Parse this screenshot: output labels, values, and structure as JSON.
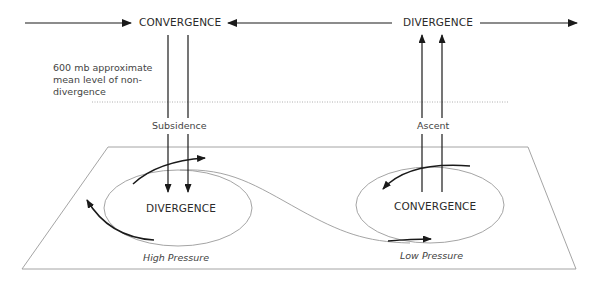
{
  "diagram": {
    "upper_level": {
      "left_label": "CONVERGENCE",
      "right_label": "DIVERGENCE"
    },
    "non_divergence_note": "600 mb approximate mean level of non-divergence",
    "vertical_motion": {
      "left_label": "Subsidence",
      "right_label": "Ascent"
    },
    "surface": {
      "high": {
        "center_label": "DIVERGENCE",
        "caption": "High Pressure"
      },
      "low": {
        "center_label": "CONVERGENCE",
        "caption": "Low Pressure"
      }
    },
    "colors": {
      "arrow": "#1a1a1a",
      "outline": "#9a9a9a",
      "dotted": "#b0b0b0",
      "text": "#2a2a2a"
    }
  }
}
